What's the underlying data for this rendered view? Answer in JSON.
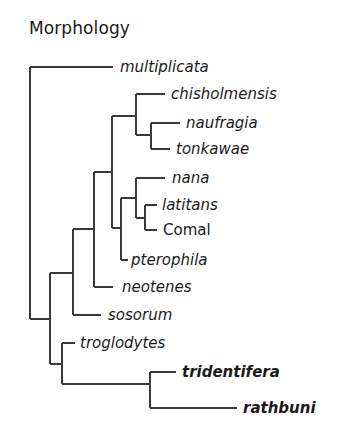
{
  "figure": {
    "title": "Morphology",
    "line_color": "#3a3a3a",
    "text_color": "#1a1a1a",
    "background": "#ffffff"
  },
  "tree": {
    "taxa": [
      {
        "id": "multiplicata",
        "label": "multiplicata",
        "style": "italic",
        "branch": {
          "x1": 30,
          "x2": 113,
          "y": 67
        },
        "label_x": 120
      },
      {
        "id": "chisholmensis",
        "label": "chisholmensis",
        "style": "italic",
        "branch": {
          "x1": 136,
          "x2": 165,
          "y": 94
        },
        "label_x": 171
      },
      {
        "id": "naufragia",
        "label": "naufragia",
        "style": "italic",
        "branch": {
          "x1": 151,
          "x2": 180,
          "y": 123
        },
        "label_x": 186
      },
      {
        "id": "tonkawae",
        "label": "tonkawae",
        "style": "italic",
        "branch": {
          "x1": 151,
          "x2": 170,
          "y": 149
        },
        "label_x": 176
      },
      {
        "id": "nana",
        "label": "nana",
        "style": "italic",
        "branch": {
          "x1": 136,
          "x2": 165,
          "y": 178
        },
        "label_x": 172
      },
      {
        "id": "latitans",
        "label": "latitans",
        "style": "italic",
        "branch": {
          "x1": 145,
          "x2": 157,
          "y": 205
        },
        "label_x": 162
      },
      {
        "id": "comal",
        "label": "Comal",
        "style": "normal",
        "branch": {
          "x1": 145,
          "x2": 157,
          "y": 230
        },
        "label_x": 163
      },
      {
        "id": "pterophila",
        "label": "pterophila",
        "style": "italic",
        "branch": {
          "x1": 121,
          "x2": 128,
          "y": 260
        },
        "label_x": 131
      },
      {
        "id": "neotenes",
        "label": "neotenes",
        "style": "italic",
        "branch": {
          "x1": 94,
          "x2": 113,
          "y": 287
        },
        "label_x": 122
      },
      {
        "id": "sosorum",
        "label": "sosorum",
        "style": "italic",
        "branch": {
          "x1": 73,
          "x2": 101,
          "y": 315
        },
        "label_x": 108
      },
      {
        "id": "troglodytes",
        "label": "troglodytes",
        "style": "italic",
        "branch": {
          "x1": 62,
          "x2": 75,
          "y": 343
        },
        "label_x": 80
      },
      {
        "id": "tridentifera",
        "label": "tridentifera",
        "style": "bold-italic",
        "branch": {
          "x1": 150,
          "x2": 176,
          "y": 372
        },
        "label_x": 182
      },
      {
        "id": "rathbuni",
        "label": "rathbuni",
        "style": "bold-italic",
        "branch": {
          "x1": 150,
          "x2": 237,
          "y": 408
        },
        "label_x": 243
      }
    ],
    "internal_nodes": [
      {
        "id": "root",
        "x": 30,
        "y1": 67,
        "y2": 319
      },
      {
        "id": "naufragia_tonkawae",
        "x": 151,
        "y1": 123,
        "y2": 149
      },
      {
        "id": "chisholmensis_clade",
        "x": 136,
        "y1": 94,
        "y2": 135
      },
      {
        "id": "latitans_comal",
        "x": 145,
        "y1": 205,
        "y2": 230
      },
      {
        "id": "nana_clade",
        "x": 136,
        "y1": 178,
        "y2": 218
      },
      {
        "id": "pterophila_clade",
        "x": 121,
        "y1": 198,
        "y2": 260
      },
      {
        "id": "central_clade",
        "x": 112,
        "y1": 116,
        "y2": 228
      },
      {
        "id": "neotenes_clade",
        "x": 94,
        "y1": 172,
        "y2": 287
      },
      {
        "id": "sosorum_clade",
        "x": 73,
        "y1": 229,
        "y2": 315
      },
      {
        "id": "ingroup",
        "x": 50,
        "y1": 273,
        "y2": 364
      },
      {
        "id": "troglodytes_clade",
        "x": 62,
        "y1": 343,
        "y2": 384
      },
      {
        "id": "tridentifera_rathbuni",
        "x": 150,
        "y1": 372,
        "y2": 408
      }
    ],
    "connectors": [
      {
        "from_x": 136,
        "to_x": 151,
        "y": 135
      },
      {
        "from_x": 112,
        "to_x": 136,
        "y": 116
      },
      {
        "from_x": 136,
        "to_x": 145,
        "y": 218
      },
      {
        "from_x": 121,
        "to_x": 136,
        "y": 198
      },
      {
        "from_x": 112,
        "to_x": 121,
        "y": 228
      },
      {
        "from_x": 94,
        "to_x": 112,
        "y": 172
      },
      {
        "from_x": 73,
        "to_x": 94,
        "y": 229
      },
      {
        "from_x": 50,
        "to_x": 73,
        "y": 273
      },
      {
        "from_x": 30,
        "to_x": 50,
        "y": 319
      },
      {
        "from_x": 50,
        "to_x": 62,
        "y": 364
      },
      {
        "from_x": 62,
        "to_x": 150,
        "y": 384
      }
    ]
  }
}
